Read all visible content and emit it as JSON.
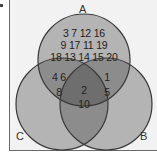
{
  "diagram": {
    "type": "venn",
    "sets": [
      "A",
      "B",
      "C"
    ],
    "labels": {
      "a": "A",
      "b": "B",
      "c": "C"
    },
    "regions": {
      "a_only": {
        "lines": [
          "3 7 12 16",
          "9 17 11 19",
          "18 13 14 15 20"
        ],
        "values": [
          3,
          7,
          12,
          16,
          9,
          17,
          11,
          19,
          18,
          13,
          14,
          15,
          20
        ]
      },
      "a_and_c_only": {
        "lines": [
          "4 6",
          "8"
        ],
        "values": [
          4,
          6,
          8
        ]
      },
      "a_and_b_only": {
        "lines": [
          "1",
          "5"
        ],
        "values": [
          1,
          5
        ]
      },
      "a_b_c": {
        "lines": [
          "2",
          "10"
        ],
        "values": [
          2,
          10
        ]
      },
      "c_only": {
        "lines": [],
        "values": []
      },
      "b_only": {
        "lines": [],
        "values": []
      },
      "b_and_c_only": {
        "lines": [],
        "values": []
      }
    },
    "colors": {
      "background": "#f2f2f2",
      "circle_fill": "#b4b4b4",
      "double_overlap": "#8c8c8c",
      "triple_overlap": "#6e6e6e",
      "stroke": "#3a3a3a"
    }
  }
}
